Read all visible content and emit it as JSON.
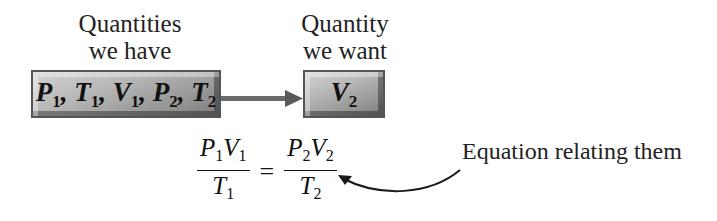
{
  "diagram": {
    "have_label_line1": "Quantities",
    "have_label_line2": "we have",
    "want_label_line1": "Quantity",
    "want_label_line2": "we want",
    "have_box": {
      "vars": [
        {
          "sym": "P",
          "sub": "1",
          "sep": ", "
        },
        {
          "sym": "T",
          "sub": "1",
          "sep": ", "
        },
        {
          "sym": "V",
          "sub": "1",
          "sep": ", "
        },
        {
          "sym": "P",
          "sub": "2",
          "sep": ", "
        },
        {
          "sym": "T",
          "sub": "2",
          "sep": ""
        }
      ]
    },
    "want_box": {
      "vars": [
        {
          "sym": "V",
          "sub": "2"
        }
      ]
    },
    "equation": {
      "left": {
        "num": [
          {
            "sym": "P",
            "sub": "1"
          },
          {
            "sym": "V",
            "sub": "1"
          }
        ],
        "den": {
          "sym": "T",
          "sub": "1"
        }
      },
      "operator": "=",
      "right": {
        "num": [
          {
            "sym": "P",
            "sub": "2"
          },
          {
            "sym": "V",
            "sub": "2"
          }
        ],
        "den": {
          "sym": "T",
          "sub": "2"
        }
      }
    },
    "equation_caption": "Equation relating them",
    "colors": {
      "box_fill": "#a8a8a8",
      "arrow": "#6a6a6a",
      "text": "#111111"
    }
  }
}
